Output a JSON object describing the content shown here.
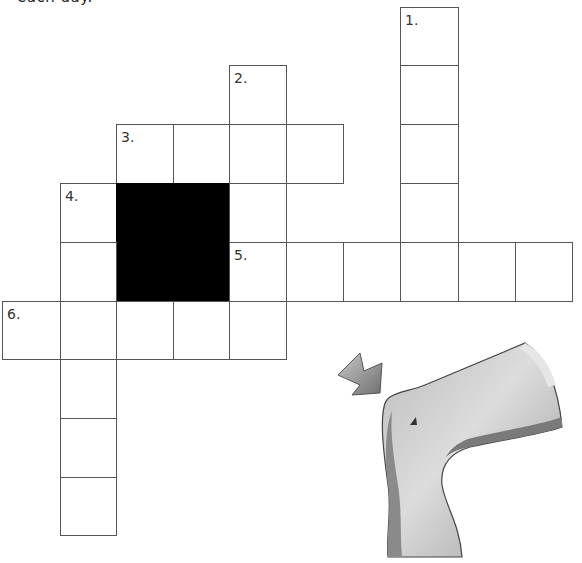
{
  "document": {
    "top_text": "each day."
  },
  "crossword": {
    "clue_numbers": {
      "c1": "1.",
      "c2": "2.",
      "c3": "3.",
      "c4": "4.",
      "c5": "5.",
      "c6": "6."
    },
    "words": [
      {
        "number": "1",
        "direction": "down",
        "length": 6
      },
      {
        "number": "2",
        "direction": "down",
        "length": 4
      },
      {
        "number": "3",
        "direction": "across",
        "length": 4
      },
      {
        "number": "4",
        "direction": "down",
        "length": 7
      },
      {
        "number": "5",
        "direction": "across",
        "length": 6
      },
      {
        "number": "6",
        "direction": "across",
        "length": 5
      }
    ]
  },
  "illustration": {
    "subject": "dinosaur neck and head (gray)",
    "arrow": "pointing arrow toward head",
    "colors": {
      "body": "#9a9a9a",
      "highlight": "#d8d8d8",
      "shadow": "#6e6e6e"
    }
  }
}
